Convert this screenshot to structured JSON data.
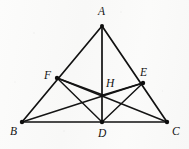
{
  "figure": {
    "type": "euclidean-geometry-diagram",
    "canvas": {
      "width": 189,
      "height": 149
    },
    "background_color": "#fbfbfa",
    "line_color": "#111111",
    "label_color": "#141414",
    "points": [
      {
        "id": "A",
        "label": "A",
        "x": 102,
        "y": 26,
        "label_x": 98,
        "label_y": 6,
        "dot": true,
        "role": "apex-vertex"
      },
      {
        "id": "B",
        "label": "B",
        "x": 22,
        "y": 122,
        "label_x": 10,
        "label_y": 126,
        "dot": true,
        "role": "base-left-vertex"
      },
      {
        "id": "C",
        "label": "C",
        "x": 167,
        "y": 122,
        "label_x": 172,
        "label_y": 126,
        "dot": true,
        "role": "base-right-vertex"
      },
      {
        "id": "D",
        "label": "D",
        "x": 102,
        "y": 122,
        "label_x": 98,
        "label_y": 128,
        "dot": true,
        "role": "foot-of-altitude-on-BC"
      },
      {
        "id": "E",
        "label": "E",
        "x": 143,
        "y": 83,
        "label_x": 140,
        "label_y": 67,
        "dot": true,
        "role": "point-on-AC"
      },
      {
        "id": "F",
        "label": "F",
        "x": 57,
        "y": 78,
        "label_x": 44,
        "label_y": 70,
        "dot": true,
        "role": "point-on-AB"
      },
      {
        "id": "H",
        "label": "H",
        "x": 103,
        "y": 95,
        "label_x": 106,
        "label_y": 78,
        "dot": false,
        "role": "intersection-orthocenter"
      }
    ],
    "segments": [
      {
        "id": "AB",
        "from": "A",
        "to": "B",
        "name": "side-ab"
      },
      {
        "id": "AC",
        "from": "A",
        "to": "C",
        "name": "side-ac"
      },
      {
        "id": "BC",
        "from": "B",
        "to": "C",
        "name": "side-bc"
      },
      {
        "id": "AD",
        "from": "A",
        "to": "D",
        "name": "altitude-ad"
      },
      {
        "id": "BE",
        "from": "B",
        "to": "E",
        "name": "cevian-be"
      },
      {
        "id": "CF",
        "from": "C",
        "to": "F",
        "name": "cevian-cf"
      },
      {
        "id": "FD",
        "from": "F",
        "to": "D",
        "name": "segment-fd"
      },
      {
        "id": "ED",
        "from": "E",
        "to": "D",
        "name": "segment-ed"
      },
      {
        "id": "FH",
        "from": "F",
        "to": "H",
        "name": "segment-fh"
      },
      {
        "id": "EH",
        "from": "E",
        "to": "H",
        "name": "segment-eh"
      }
    ],
    "labels": {
      "A": "A",
      "B": "B",
      "C": "C",
      "D": "D",
      "E": "E",
      "F": "F",
      "H": "H"
    }
  }
}
